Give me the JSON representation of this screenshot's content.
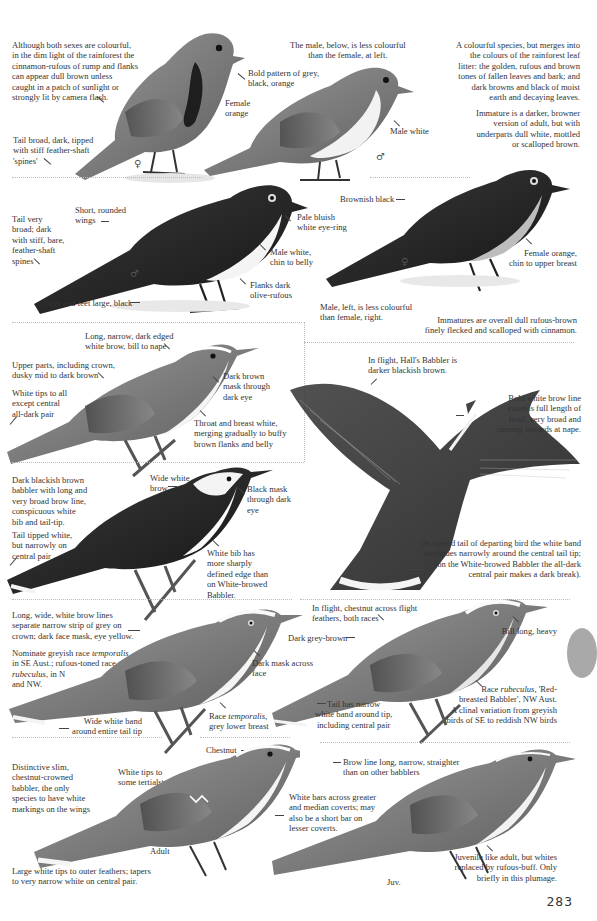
{
  "page": {
    "number": "283",
    "thumb_tab_color": "#a9a9a9"
  },
  "section1": {
    "left_intro": "Although both sexes are colourful,\nin the dim light of the rainforest the\ncinnamon-rufous of rump and flanks\ncan appear dull brown unless\ncaught in a patch of sunlight or\nstrongly lit by camera flash.",
    "tail_note": "Tail broad, dark, tipped\nwith stiff feather-shaft\n'spines'",
    "bold_pattern": "Bold pattern of grey,\nblack, orange",
    "female_orange": "Female\norange",
    "male_note": "The male, below, is less colourful\nthan the female, at left.",
    "male_white": "Male white",
    "right_intro": "A colourful species, but merges into\nthe colours of the rainforest leaf\nlitter: the golden, rufous and brown\ntones of fallen leaves and bark; and\ndark browns and black of moist\nearth and decaying leaves.",
    "immature": "Immature is a darker, browner\nversion of adult, but with\nunderparts dull white, mottled\nor scalloped brown.",
    "female_symbol": "♀",
    "male_symbol": "♂"
  },
  "section2": {
    "tail_very_broad": "Tail very\nbroad; dark\nwith stiff, bare,\nfeather-shaft\nspines",
    "short_wings": "Short, rounded\nwings",
    "pale_eye_ring": "Pale bluish\nwhite eye-ring",
    "male_chin_belly": "Male white,\nchin to belly",
    "flanks": "Flanks dark\nolive-rufous",
    "legs": "Legs and feet large, black",
    "brownish_black": "Brownish black",
    "female_chin_breast": "Female orange,\nchin to upper breast",
    "male_left": "Male, left, is less colourful\nthan female, right.",
    "immatures": "Immatures are overall dull rufous-brown\nfinely flecked and scalloped with cinnamon.",
    "male_symbol": "♂",
    "female_symbol": "♀"
  },
  "section3": {
    "long_narrow_brow": "Long, narrow, dark edged\nwhite brow, bill to nape",
    "upper_parts": "Upper parts, including crown,\ndusky mid to dark brown",
    "white_tips": "White tips to all\nexcept central\nall-dark pair",
    "dark_brown_mask": "Dark brown\nmask through\ndark eye",
    "throat_breast": "Throat and breast white,\nmerging gradually to buffy\nbrown flanks and belly",
    "in_flight_halls": "In flight, Hall's Babbler is\ndarker blackish brown.",
    "bold_brow": "Bold white brow line\nextends full length of\nhead, very broad and\ncurving inwards at nape."
  },
  "section4": {
    "dark_blackish": "Dark blackish brown\nbabbler with long and\nvery broad brow line,\nconspicuous white\nbib and tail-tip.",
    "wide_white_brow": "Wide white\nbrow",
    "black_mask": "Black mask\nthrough dark\neye",
    "tail_tipped": "Tail tipped white,\nbut narrowly on\ncentral pair",
    "white_bib": "White bib has\nmore sharply\ndefined edge than\non White-browed\nBabbler.",
    "spread_tail": "On spread tail of departing bird the white band\ncontinues narrowly around the central tail tip;\n(on the White-browed Babbler the all-dark\ncentral pair makes a dark break)."
  },
  "section5": {
    "long_wide_brow": "Long, wide, white brow lines\nseparate narrow strip of grey on\ncrown; dark face mask, eye yellow.",
    "nominate_prefix": "Nominate greyish race ",
    "nominate_race": "temporalis",
    "nominate_mid": "\nin SE Aust.; rufous-toned race\n",
    "rufous_race": "rubeculus",
    "nominate_suffix": ", in N\nand NW.",
    "dark_mask_face": "Dark mask across\nface",
    "wide_band": "Wide white band\naround entire tail tip",
    "race_temporalis_prefix": "Race ",
    "race_temporalis_name": "temporalis,",
    "race_temporalis_suffix": "\ngrey lower breast",
    "in_flight_chestnut": "In flight, chestnut across flight\nfeathers, both races",
    "dark_grey_brown": "Dark grey-brown",
    "bill_long": "Bill long, heavy",
    "tail_narrow_band": "Tail has narrow\nwhite band around tip,\nincluding central pair",
    "race_rubeculus_prefix": "Race ",
    "race_rubeculus_name": "rubeculus,",
    "race_rubeculus_suffix": " 'Red-\nbreasted Babbler', NW Aust.\nA clinal variation from greyish\nbirds of SE to reddish NW birds"
  },
  "section6": {
    "chestnut": "Chestnut",
    "distinctive": "Distinctive slim,\nchestnut-crowned\nbabbler, the only\nspecies to have white\nmarkings on the wings",
    "white_tips_tertials": "White tips to\nsome tertials",
    "brow_line_long": "Brow line long, narrow, straighter\nthan on other babblers",
    "white_bars": "White bars across greater\nand median coverts; may\nalso be a short bar on\nlesser coverts.",
    "adult": "Adult",
    "large_white_tips": "Large white tips to outer feathers; tapers\nto very narrow white on central pair.",
    "juv": "Juv.",
    "juvenile": "Juvenile like adult, but whites\nreplaced by rufous-buff. Only\nbriefly in this plumage."
  }
}
